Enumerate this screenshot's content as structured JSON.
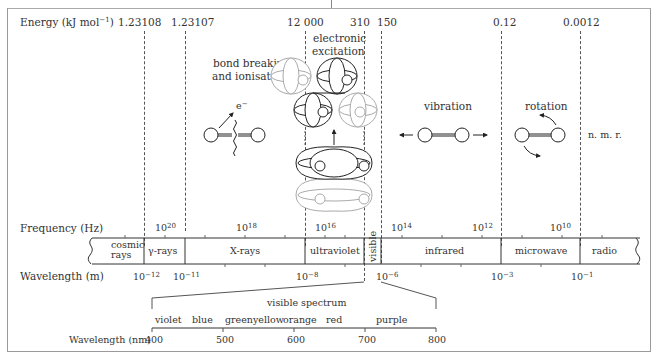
{
  "energy": {
    "axis_label": "Energy (kJ mol",
    "axis_unit_sup": "−1",
    "axis_close": ")",
    "ticks": [
      "1.23108",
      "1.23107",
      "12 000",
      "310",
      "150",
      "0.12",
      "0.0012"
    ]
  },
  "regions": {
    "bond_breaking": "bond breaking",
    "ionisation": "and ionisation",
    "electronic_1": "electronic",
    "electronic_2": "excitation",
    "vibration": "vibration",
    "rotation": "rotation",
    "nmr": "n. m. r.",
    "electron": "e",
    "electron_sup": "−"
  },
  "frequency": {
    "axis_label": "Frequency (Hz)",
    "ticks": [
      {
        "base": "10",
        "exp": "20"
      },
      {
        "base": "10",
        "exp": "18"
      },
      {
        "base": "10",
        "exp": "16"
      },
      {
        "base": "10",
        "exp": "14"
      },
      {
        "base": "10",
        "exp": "12"
      },
      {
        "base": "10",
        "exp": "10"
      }
    ]
  },
  "bands": {
    "cosmic_1": "cosmic",
    "cosmic_2": "rays",
    "gamma": "γ-rays",
    "xrays": "X-rays",
    "ultraviolet": "ultraviolet",
    "visible": "visible",
    "infrared": "infrared",
    "microwave": "microwave",
    "radio": "radio"
  },
  "wavelength_m": {
    "axis_label": "Wavelength (m)",
    "ticks": [
      {
        "base": "10",
        "exp": "−12"
      },
      {
        "base": "10",
        "exp": "−11"
      },
      {
        "base": "10",
        "exp": "−8"
      },
      {
        "base": "10",
        "exp": "−6"
      },
      {
        "base": "10",
        "exp": "−3"
      },
      {
        "base": "10",
        "exp": "−1"
      }
    ]
  },
  "visible_spectrum": {
    "title": "visible spectrum",
    "colors": [
      "violet",
      "blue",
      "green",
      "yellow",
      "orange",
      "red",
      "purple"
    ],
    "axis_label": "Wavelength (nm)",
    "ticks": [
      "400",
      "500",
      "600",
      "700",
      "800"
    ]
  }
}
